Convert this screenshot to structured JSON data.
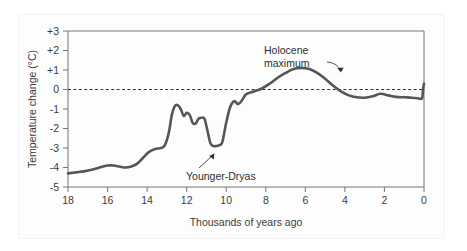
{
  "chart_data": {
    "type": "line",
    "title": "",
    "xlabel": "Thousands of years ago",
    "ylabel": "Temperature change (°C)",
    "xlim": [
      18,
      0
    ],
    "ylim": [
      -5,
      3
    ],
    "x_ticks": [
      "18",
      "16",
      "14",
      "12",
      "10",
      "8",
      "6",
      "4",
      "2",
      "0"
    ],
    "x_tick_values": [
      18,
      16,
      14,
      12,
      10,
      8,
      6,
      4,
      2,
      0
    ],
    "y_ticks": [
      "+3",
      "+2",
      "+1",
      "0",
      "-1",
      "-2",
      "-3",
      "-4",
      "-5"
    ],
    "y_tick_values": [
      3,
      2,
      1,
      0,
      -1,
      -2,
      -3,
      -4,
      -5
    ],
    "grid": false,
    "reference_line": {
      "value": 0,
      "style": "dashed",
      "color": "#333333"
    },
    "line_color": "#565656",
    "legend": null,
    "series": [
      {
        "name": "Temperature change",
        "x": [
          18.0,
          17.6,
          17.2,
          16.8,
          16.4,
          16.0,
          15.7,
          15.4,
          15.1,
          14.8,
          14.5,
          14.2,
          13.9,
          13.6,
          13.3,
          13.1,
          12.9,
          12.75,
          12.6,
          12.45,
          12.3,
          12.15,
          12.0,
          11.85,
          11.7,
          11.55,
          11.4,
          11.25,
          11.1,
          10.95,
          10.8,
          10.65,
          10.5,
          10.35,
          10.2,
          10.0,
          9.8,
          9.6,
          9.4,
          9.2,
          9.0,
          8.6,
          8.2,
          7.8,
          7.4,
          7.0,
          6.6,
          6.2,
          5.8,
          5.4,
          5.0,
          4.6,
          4.2,
          3.8,
          3.4,
          3.0,
          2.6,
          2.2,
          1.8,
          1.4,
          1.0,
          0.6,
          0.3,
          0.1,
          0.05,
          0.0
        ],
        "y": [
          -4.3,
          -4.25,
          -4.2,
          -4.12,
          -4.0,
          -3.9,
          -3.9,
          -3.95,
          -4.0,
          -3.95,
          -3.8,
          -3.5,
          -3.2,
          -3.05,
          -3.0,
          -2.85,
          -2.2,
          -1.3,
          -0.85,
          -0.8,
          -1.0,
          -1.35,
          -1.2,
          -1.3,
          -1.7,
          -1.75,
          -1.5,
          -1.45,
          -1.5,
          -2.1,
          -2.75,
          -2.9,
          -2.9,
          -2.85,
          -2.7,
          -1.7,
          -0.9,
          -0.6,
          -0.75,
          -0.55,
          -0.25,
          -0.1,
          0.05,
          0.3,
          0.6,
          0.85,
          1.05,
          1.1,
          1.05,
          0.85,
          0.55,
          0.2,
          -0.1,
          -0.3,
          -0.4,
          -0.42,
          -0.35,
          -0.22,
          -0.3,
          -0.38,
          -0.4,
          -0.42,
          -0.45,
          -0.45,
          0.0,
          0.3
        ]
      }
    ],
    "annotations": [
      {
        "label": "Holocene\nmaximum",
        "label_line_1": "Holocene",
        "label_line_2": "maximum",
        "points_to_x": 6.3,
        "points_to_y": 1.1
      },
      {
        "label": "Younger-Dryas",
        "points_to_x": 10.7,
        "points_to_y": -2.95
      }
    ]
  }
}
